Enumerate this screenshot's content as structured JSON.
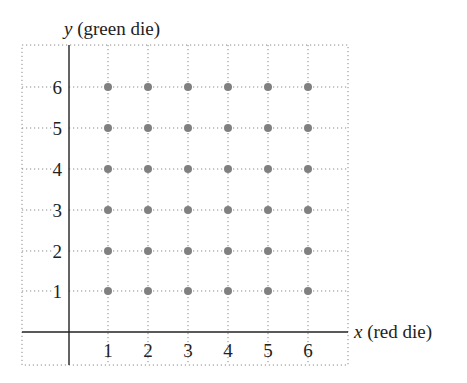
{
  "chart_data": {
    "type": "scatter",
    "title": "",
    "xlabel": "x (red die)",
    "ylabel": "y (green die)",
    "xlabel_var": "x",
    "xlabel_rest": " (red die)",
    "ylabel_var": "y",
    "ylabel_rest": " (green die)",
    "x_ticks": [
      1,
      2,
      3,
      4,
      5,
      6
    ],
    "y_ticks": [
      1,
      2,
      3,
      4,
      5,
      6
    ],
    "xlim": [
      0,
      7
    ],
    "ylim": [
      0,
      7
    ],
    "grid": "dotted",
    "legend": null,
    "point_color": "#808080",
    "points": [
      [
        1,
        1
      ],
      [
        2,
        1
      ],
      [
        3,
        1
      ],
      [
        4,
        1
      ],
      [
        5,
        1
      ],
      [
        6,
        1
      ],
      [
        1,
        2
      ],
      [
        2,
        2
      ],
      [
        3,
        2
      ],
      [
        4,
        2
      ],
      [
        5,
        2
      ],
      [
        6,
        2
      ],
      [
        1,
        3
      ],
      [
        2,
        3
      ],
      [
        3,
        3
      ],
      [
        4,
        3
      ],
      [
        5,
        3
      ],
      [
        6,
        3
      ],
      [
        1,
        4
      ],
      [
        2,
        4
      ],
      [
        3,
        4
      ],
      [
        4,
        4
      ],
      [
        5,
        4
      ],
      [
        6,
        4
      ],
      [
        1,
        5
      ],
      [
        2,
        5
      ],
      [
        3,
        5
      ],
      [
        4,
        5
      ],
      [
        5,
        5
      ],
      [
        6,
        5
      ],
      [
        1,
        6
      ],
      [
        2,
        6
      ],
      [
        3,
        6
      ],
      [
        4,
        6
      ],
      [
        5,
        6
      ],
      [
        6,
        6
      ]
    ]
  },
  "layout": {
    "box": {
      "left": 22,
      "right": 348,
      "top": 45,
      "bottom": 365
    },
    "origin": {
      "x": 69,
      "y": 332
    },
    "x_px": [
      108,
      148,
      188,
      228,
      268,
      308
    ],
    "y_px": [
      291,
      251,
      210,
      169,
      128,
      87
    ]
  }
}
